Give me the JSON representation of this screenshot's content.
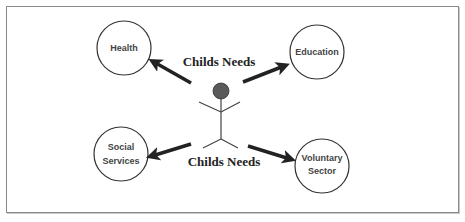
{
  "diagram": {
    "title_top": "Childs Needs",
    "title_bottom": "Childs Needs",
    "center": {
      "label": "Child",
      "icon": "stick-figure"
    },
    "nodes": [
      {
        "id": "health",
        "lines": [
          "Health"
        ]
      },
      {
        "id": "education",
        "lines": [
          "Education"
        ]
      },
      {
        "id": "social-services",
        "lines": [
          "Social",
          "Services"
        ]
      },
      {
        "id": "voluntary-sector",
        "lines": [
          "Voluntary",
          "Sector"
        ]
      }
    ],
    "edges": [
      {
        "from": "child",
        "to": "health"
      },
      {
        "from": "child",
        "to": "education"
      },
      {
        "from": "child",
        "to": "social-services"
      },
      {
        "from": "child",
        "to": "voluntary-sector"
      }
    ],
    "colors": {
      "border": "#8a8a8a",
      "arrow": "#222222",
      "head": "#5a5a5a",
      "text": "#444444"
    }
  }
}
